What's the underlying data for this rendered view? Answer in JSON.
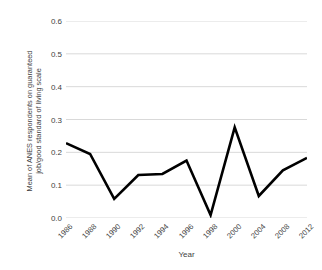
{
  "chart_data": {
    "type": "line",
    "title": "",
    "xlabel": "Year",
    "ylabel_line1": "Mean of ANES respondents on guaranteed",
    "ylabel_line2": "job/good standard of living scale",
    "categories": [
      "1986",
      "1988",
      "1990",
      "1992",
      "1994",
      "1996",
      "1998",
      "2000",
      "2004",
      "2008",
      "2012"
    ],
    "values": [
      0.228,
      0.195,
      0.058,
      0.131,
      0.134,
      0.175,
      0.009,
      0.276,
      0.067,
      0.145,
      0.183
    ],
    "series": [
      {
        "name": "Mean of ANES respondents on guaranteed job/good standard of living scale",
        "values": [
          0.228,
          0.195,
          0.058,
          0.131,
          0.134,
          0.175,
          0.009,
          0.276,
          0.067,
          0.145,
          0.183
        ]
      }
    ],
    "ylim": [
      0.0,
      0.6
    ],
    "ytick_labels": [
      "0.0",
      "0.1",
      "0.2",
      "0.3",
      "0.4",
      "0.5",
      "0.6"
    ],
    "ytick_values": [
      0.0,
      0.1,
      0.2,
      0.3,
      0.4,
      0.5,
      0.6
    ],
    "grid": "horizontal",
    "legend": "none",
    "line_color": "#000000",
    "grid_color": "#d9d9d9",
    "background_color": "#ffffff"
  }
}
